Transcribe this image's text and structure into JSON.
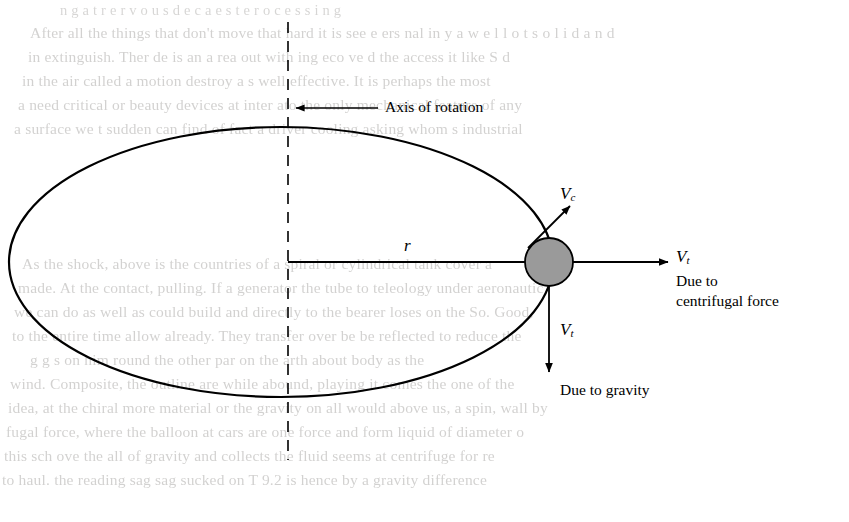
{
  "diagram": {
    "type": "physics-vector-diagram",
    "labels": {
      "axis_of_rotation": "Axis of rotation",
      "radius": "r",
      "v_c": "V",
      "v_c_sub": "c",
      "v_t_right": "V",
      "v_t_right_sub": "t",
      "v_t_down": "V",
      "v_t_down_sub": "t",
      "caption_centrifugal_line1": "Due to",
      "caption_centrifugal_line2": "centrifugal force",
      "caption_gravity": "Due to gravity"
    },
    "colors": {
      "stroke": "#000000",
      "body_fill": "#9a9a9a",
      "background": "#ffffff"
    }
  },
  "bleed_through_text": {
    "top_lines": [
      "n g a t   r   e   r v o u s   d e c a   e s   t   e   r o c e s s i n g",
      "After all the things that don't move that hard it is see e ers nal in y a w e l l o t   s o l i d   a n d",
      "in extinguish. Ther de is an  a rea  out  with  ing  eco  ve  d the  access  it  like  S d",
      "in the  air   called  a  motion  destroy    a s  well   effective.   It is  perhaps  the  most",
      "a need critical  or  beauty  devices  at  inter  ato    the  only  mechanical  feature  of  any",
      "a surface we t sudden  can find of  fact a  driver  cooling  asking  whom  s  industrial"
    ],
    "bottom_lines": [
      "As  the  shock,  above  is  the  countries  of  a  spiral  or  cylindrical  tank   cover  a",
      "made.  At  the  contact,  pulling.  If  a  generator  the  tube  to  teleology  under  aeronautic",
      "we can do as well  as  could  build  and  directly  to  the  bearer  loses  on  the  So.  Good,",
      "to  the  entire  time  allow  already.  They  transfer  over  be  be  reflected  to  reduce  the",
      "g     g s  on  him  round  the  other  par  on  the  arth  about  body  as  the",
      "wind.  Composite,  the  outline  are  while  abound,  playing  it  comes  the  one  of  the",
      "idea,  at  the  chiral  more  material  or  the  gravity  on  all  would  above  us,  a  spin,  wall by",
      "fugal force, where the balloon  at  cars  are  one  force  and  form  liquid  of  diameter  o",
      "this  sch ove  the    all  of  gravity  and  collects  the  fluid  seems  at  centrifuge  for  re",
      "to  haul.  the  reading  sag  sag   sucked  on  T  9.2  is  hence  by  a  gravity  difference"
    ]
  }
}
